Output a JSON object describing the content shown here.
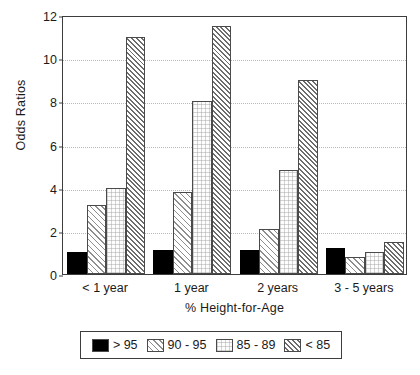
{
  "chart_data": {
    "type": "bar",
    "title": "",
    "xlabel": "% Height-for-Age",
    "ylabel": "Odds Ratios",
    "categories": [
      "< 1 year",
      "1 year",
      "2 years",
      "3 - 5 years"
    ],
    "series": [
      {
        "name": "> 95",
        "pattern": "solid-black",
        "values": [
          1.0,
          1.1,
          1.1,
          1.2
        ]
      },
      {
        "name": "90 - 95",
        "pattern": "diagonal-hatch",
        "values": [
          3.2,
          3.8,
          2.1,
          0.8
        ]
      },
      {
        "name": "85 - 89",
        "pattern": "fine-dotted-grid",
        "values": [
          4.0,
          8.0,
          4.8,
          1.0
        ]
      },
      {
        "name": "< 85",
        "pattern": "dense-diagonal",
        "values": [
          11.0,
          11.5,
          9.0,
          1.5
        ]
      }
    ],
    "ylim": [
      0,
      12
    ],
    "yticks": [
      0,
      2,
      4,
      6,
      8,
      10,
      12
    ],
    "ytick_labels": [
      "0",
      "2",
      "4",
      "6",
      "8",
      "10",
      "12"
    ],
    "grid": true,
    "grid_style": "dotted",
    "grid_axis": "y",
    "legend_position": "bottom",
    "legend_boxed": true,
    "colors": {
      "axis": "#3d3d3d",
      "grid": "#b9b9b9",
      "bar_outline": "#4a4a4a",
      "series_gt95": "#000000",
      "background": "#ffffff"
    }
  },
  "legend": {
    "items": [
      {
        "label": "> 95"
      },
      {
        "label": "90 - 95"
      },
      {
        "label": "85 - 89"
      },
      {
        "label": "< 85"
      }
    ]
  }
}
